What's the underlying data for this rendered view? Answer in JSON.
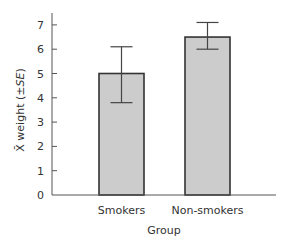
{
  "chart_data": {
    "type": "bar",
    "title": "",
    "xlabel": "Group",
    "ylabel": "X̄ weight (±SE)",
    "ylabel_parts": {
      "symbol": "X̄",
      "text": " weight (±",
      "italic": "SE",
      "close": ")"
    },
    "categories": [
      "Smokers",
      "Non-smokers"
    ],
    "values": [
      5.0,
      6.5
    ],
    "error_bars": [
      {
        "low": 3.8,
        "high": 6.1
      },
      {
        "low": 6.0,
        "high": 7.1
      }
    ],
    "ylim": [
      0,
      7.5
    ],
    "yticks": [
      0,
      1,
      2,
      3,
      4,
      5,
      6,
      7
    ],
    "grid": false,
    "legend": "none",
    "colors": {
      "bar_fill": "#cccccc",
      "bar_stroke": "#333333"
    }
  }
}
